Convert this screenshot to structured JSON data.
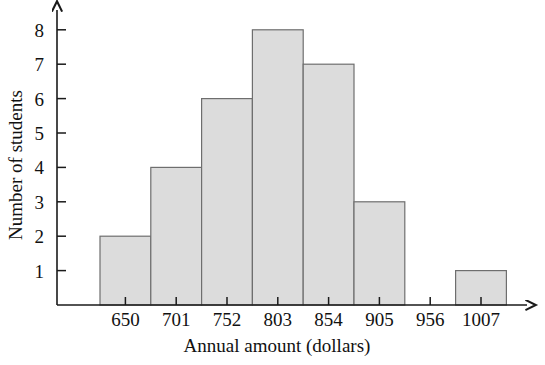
{
  "chart_data": {
    "type": "bar",
    "title": "",
    "subtitle": "",
    "xlabel": "Annual amount (dollars)",
    "ylabel": "Number of students",
    "categories": [
      "650",
      "701",
      "752",
      "803",
      "854",
      "905",
      "956",
      "1007"
    ],
    "values": [
      2,
      4,
      6,
      8,
      7,
      3,
      0,
      1
    ],
    "ytick_labels": [
      "1",
      "2",
      "3",
      "4",
      "5",
      "6",
      "7",
      "8"
    ],
    "ytick_values": [
      1,
      2,
      3,
      4,
      5,
      6,
      7,
      8
    ],
    "ylim": [
      0,
      8.7
    ],
    "xlim_note": "categorical bins, 51 px wide, centered on tick labels",
    "grid": false,
    "legend": null,
    "bar_fill_color": "#dcdcdc",
    "bar_border_color": "#6e6e6e",
    "axis_color": "#1a1a1a",
    "annotations": []
  },
  "axes": {
    "y_axis_name": "Number of students",
    "x_axis_name": "Annual amount (dollars)",
    "y_arrow": "up-arrow",
    "x_arrow": "right-arrow"
  }
}
